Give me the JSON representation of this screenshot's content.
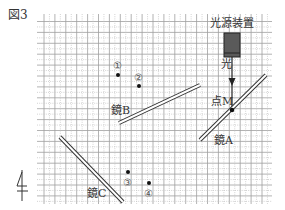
{
  "figure": {
    "title": "図3",
    "light_source_label": "光源装置",
    "light_label": "光",
    "point_m_label": "点M",
    "mirror_a_label": "鏡A",
    "mirror_b_label": "鏡B",
    "mirror_c_label": "鏡C",
    "points": [
      {
        "label": "①"
      },
      {
        "label": "②"
      },
      {
        "label": "③"
      },
      {
        "label": "④"
      }
    ],
    "north_label": "北"
  },
  "colors": {
    "grid": "#9a9a9a",
    "grid_minor": "#c4c4c4",
    "source_box": "#555555",
    "line": "#222222"
  }
}
